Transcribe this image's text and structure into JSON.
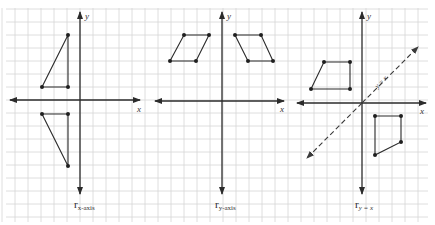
{
  "figure": {
    "grid": {
      "spacing_px": 13,
      "color": "#d6d6d6"
    },
    "panels": [
      {
        "id": "x-axis-reflection",
        "axis_labels": {
          "x": "x",
          "y": "y"
        },
        "label": {
          "symbol": "r",
          "subscript": "x-axis"
        },
        "origin": [
          80,
          100
        ],
        "shapes": [
          {
            "name": "preimage-triangle",
            "points": [
              [
                68,
                35
              ],
              [
                68,
                87
              ],
              [
                42,
                87
              ]
            ]
          },
          {
            "name": "image-triangle",
            "points": [
              [
                42,
                114
              ],
              [
                68,
                114
              ],
              [
                68,
                166
              ]
            ]
          }
        ]
      },
      {
        "id": "y-axis-reflection",
        "axis_labels": {
          "x": "x",
          "y": "y"
        },
        "label": {
          "symbol": "r",
          "subscript": "y-axis"
        },
        "origin": [
          222,
          101
        ],
        "shapes": [
          {
            "name": "preimage-parallelogram",
            "points": [
              [
                184,
                35
              ],
              [
                209,
                35
              ],
              [
                196,
                61
              ],
              [
                170,
                61
              ]
            ]
          },
          {
            "name": "image-parallelogram",
            "points": [
              [
                235,
                35
              ],
              [
                261,
                35
              ],
              [
                273,
                61
              ],
              [
                248,
                61
              ]
            ]
          }
        ]
      },
      {
        "id": "y-equals-x-reflection",
        "axis_labels": {
          "x": "x",
          "y": "y"
        },
        "line_label": "y = x",
        "label": {
          "symbol": "r",
          "subscript": "y = x"
        },
        "origin": [
          362,
          103
        ],
        "shapes": [
          {
            "name": "preimage-quadrilateral",
            "points": [
              [
                324,
                62
              ],
              [
                350,
                62
              ],
              [
                350,
                89
              ],
              [
                311,
                89
              ]
            ]
          },
          {
            "name": "image-quadrilateral",
            "points": [
              [
                375,
                116
              ],
              [
                401,
                116
              ],
              [
                401,
                142
              ],
              [
                375,
                155
              ]
            ]
          }
        ]
      }
    ]
  }
}
